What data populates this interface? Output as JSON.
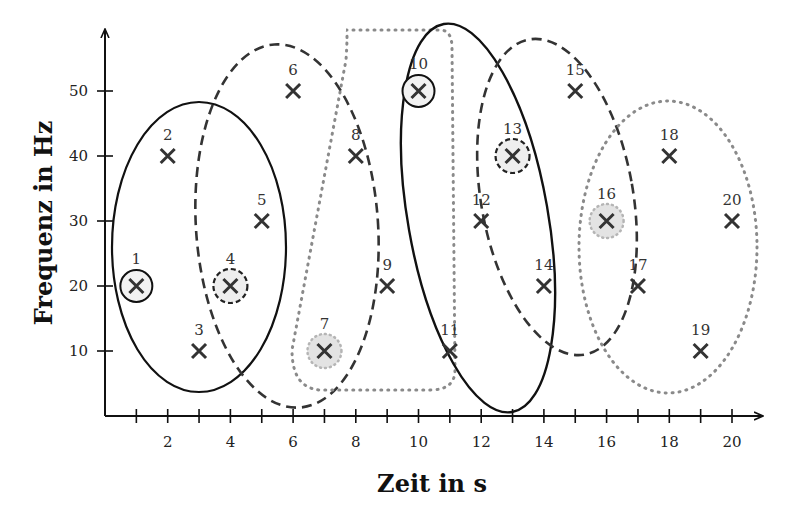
{
  "chart_data": {
    "type": "scatter",
    "title": "",
    "xlabel": "Zeit in s",
    "ylabel": "Frequenz in Hz",
    "xlim": [
      0,
      20.5
    ],
    "ylim": [
      0,
      58
    ],
    "grid": false,
    "x_ticks": [
      1,
      2,
      3,
      4,
      5,
      6,
      7,
      8,
      9,
      10,
      11,
      12,
      13,
      14,
      15,
      16,
      17,
      18,
      19,
      20
    ],
    "x_tick_labels": [
      "2",
      "4",
      "6",
      "8",
      "10",
      "12",
      "14",
      "16",
      "18",
      "20"
    ],
    "y_ticks": [
      10,
      20,
      30,
      40,
      50
    ],
    "y_tick_labels": [
      "10",
      "20",
      "30",
      "40",
      "50"
    ],
    "points": [
      {
        "id": "1",
        "x": 1,
        "y": 20,
        "marker": "solid-circle"
      },
      {
        "id": "2",
        "x": 2,
        "y": 40
      },
      {
        "id": "3",
        "x": 3,
        "y": 10
      },
      {
        "id": "4",
        "x": 4,
        "y": 20,
        "marker": "dashed-circle"
      },
      {
        "id": "5",
        "x": 5,
        "y": 30
      },
      {
        "id": "6",
        "x": 6,
        "y": 50
      },
      {
        "id": "7",
        "x": 7,
        "y": 10,
        "marker": "dotted-circle"
      },
      {
        "id": "8",
        "x": 8,
        "y": 40
      },
      {
        "id": "9",
        "x": 9,
        "y": 20
      },
      {
        "id": "10",
        "x": 10,
        "y": 50,
        "marker": "solid-circle"
      },
      {
        "id": "11",
        "x": 11,
        "y": 10
      },
      {
        "id": "12",
        "x": 12,
        "y": 30
      },
      {
        "id": "13",
        "x": 13,
        "y": 40,
        "marker": "dashed-circle"
      },
      {
        "id": "14",
        "x": 14,
        "y": 20
      },
      {
        "id": "15",
        "x": 15,
        "y": 50
      },
      {
        "id": "16",
        "x": 16,
        "y": 30,
        "marker": "dotted-circle"
      },
      {
        "id": "17",
        "x": 17,
        "y": 20
      },
      {
        "id": "18",
        "x": 18,
        "y": 40
      },
      {
        "id": "19",
        "x": 19,
        "y": 10
      },
      {
        "id": "20",
        "x": 20,
        "y": 30
      }
    ],
    "clusters": [
      {
        "style": "solid",
        "center_point": "1",
        "members": [
          "1",
          "2",
          "3",
          "4",
          "5"
        ]
      },
      {
        "style": "dashed",
        "center_point": "4",
        "members": [
          "4",
          "5",
          "6",
          "7",
          "8",
          "9"
        ]
      },
      {
        "style": "dotted",
        "center_point": "7",
        "members": [
          "7",
          "8",
          "9",
          "10",
          "11"
        ]
      },
      {
        "style": "solid",
        "center_point": "10",
        "members": [
          "10",
          "11",
          "12",
          "13",
          "14"
        ]
      },
      {
        "style": "dashed",
        "center_point": "13",
        "members": [
          "13",
          "14",
          "15",
          "16",
          "17"
        ]
      },
      {
        "style": "dotted",
        "center_point": "16",
        "members": [
          "16",
          "17",
          "18",
          "19",
          "20"
        ]
      }
    ],
    "colors": {
      "solid": "#111111",
      "dashed": "#333333",
      "dotted": "#8a8a8a",
      "highlight_fill": "#e6e6e6",
      "cross": "#333333"
    }
  }
}
